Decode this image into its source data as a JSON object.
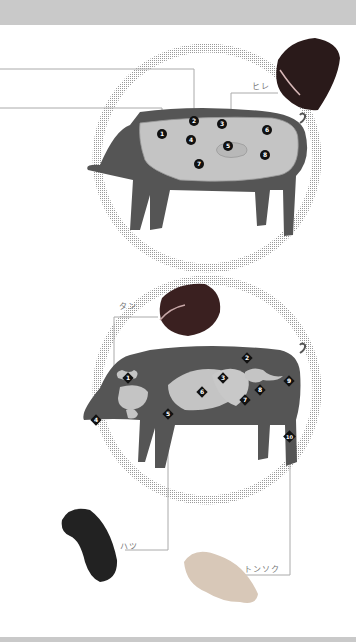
{
  "diagram_title": "Pork cuts and offal diagram",
  "colors": {
    "body": "#505050",
    "cut": "#c4c4c4",
    "marker": "#111111",
    "dots": "#b0b0b0",
    "line": "#aaaaaa",
    "bar": "#c9c9c9"
  },
  "meat_diagram": {
    "markers": [
      "1",
      "2",
      "3",
      "4",
      "5",
      "6",
      "7",
      "8"
    ],
    "callout": {
      "label": "ヒレ",
      "marker": "5"
    }
  },
  "offal_diagram": {
    "markers": [
      "1",
      "2",
      "3",
      "4",
      "5",
      "6",
      "7",
      "8",
      "9",
      "10"
    ],
    "callouts": [
      {
        "label": "タン",
        "marker": "1"
      },
      {
        "label": "ハツ",
        "marker": "5"
      },
      {
        "label": "トンソク",
        "marker": "10"
      }
    ]
  }
}
